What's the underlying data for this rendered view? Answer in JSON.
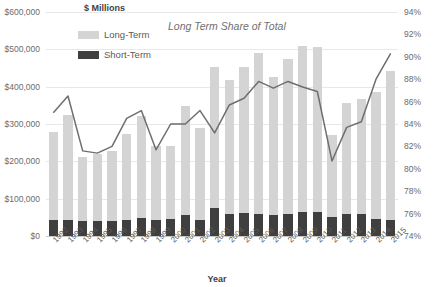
{
  "header": {
    "units_title": "$ Millions",
    "series_annotation": "Long Term Share of Total"
  },
  "legend": {
    "items": [
      {
        "label": "Long-Term",
        "color": "#d4d4d4"
      },
      {
        "label": "Short-Term",
        "color": "#3f3f3f"
      }
    ]
  },
  "axes": {
    "x_title": "Year",
    "y_left_ticks": [
      "$600,000",
      "$500,000",
      "$400,000",
      "$300,000",
      "$200,000",
      "$100,000",
      "$0"
    ],
    "y_right_ticks": [
      "94%",
      "92%",
      "90%",
      "88%",
      "86%",
      "84%",
      "82%",
      "80%",
      "78%",
      "76%",
      "74%"
    ]
  },
  "colors": {
    "long_term": "#d4d4d4",
    "short_term": "#3f3f3f",
    "line": "#6e6e6e",
    "grid": "#e8e8e8",
    "text": "#5a5a5a"
  },
  "chart_data": {
    "type": "bar",
    "title": "",
    "subtitle": "",
    "xlabel": "Year",
    "ylabel": "$ Millions",
    "y2label": "",
    "grid": true,
    "legend_position": "top-left",
    "stacked": true,
    "ylim": [
      0,
      600000
    ],
    "y2lim": [
      74,
      94
    ],
    "yticks": [
      0,
      100000,
      200000,
      300000,
      400000,
      500000,
      600000
    ],
    "y2ticks": [
      74,
      76,
      78,
      80,
      82,
      84,
      86,
      88,
      90,
      92,
      94
    ],
    "categories": [
      "1992",
      "1993",
      "1994",
      "1995",
      "1996",
      "1997",
      "1998",
      "1999",
      "2000",
      "2001",
      "2002",
      "2003",
      "2004",
      "2005",
      "2006",
      "2007",
      "2008",
      "2009",
      "2010",
      "2011",
      "2012",
      "2013",
      "2014",
      "2015"
    ],
    "series": [
      {
        "name": "Long-Term",
        "type": "bar",
        "axis": "left",
        "color": "#d4d4d4",
        "values": [
          237000,
          281000,
          173000,
          180000,
          186000,
          230000,
          274000,
          196000,
          195000,
          292000,
          247000,
          376000,
          359000,
          392000,
          431000,
          372000,
          417000,
          445000,
          442000,
          218000,
          298000,
          310000,
          340000,
          400000
        ]
      },
      {
        "name": "Short-Term",
        "type": "bar",
        "axis": "left",
        "color": "#3f3f3f",
        "values": [
          42000,
          44000,
          39000,
          41000,
          41000,
          42000,
          48000,
          44000,
          45000,
          56000,
          43000,
          76000,
          60000,
          62000,
          60000,
          55000,
          58000,
          65000,
          64000,
          52000,
          58000,
          58000,
          46000,
          43000
        ]
      },
      {
        "name": "Total",
        "type": "bar-total",
        "axis": "left",
        "values": [
          279000,
          325000,
          212000,
          221000,
          227000,
          272000,
          322000,
          240000,
          240000,
          348000,
          290000,
          452000,
          419000,
          454000,
          491000,
          427000,
          475000,
          510000,
          506000,
          270000,
          356000,
          368000,
          386000,
          443000
        ]
      },
      {
        "name": "Long Term Share of Total",
        "type": "line",
        "axis": "right",
        "color": "#6e6e6e",
        "values": [
          85.0,
          86.5,
          81.6,
          81.4,
          82.0,
          84.5,
          85.2,
          81.7,
          84.0,
          84.0,
          85.2,
          83.2,
          85.7,
          86.3,
          87.8,
          87.2,
          87.8,
          87.3,
          86.9,
          80.7,
          83.7,
          84.2,
          88.0,
          90.3
        ]
      }
    ]
  }
}
